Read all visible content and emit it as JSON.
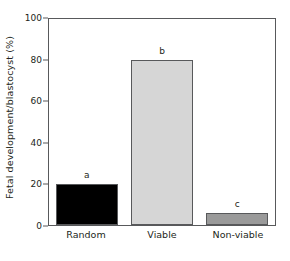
{
  "chart_data": {
    "type": "bar",
    "title": "",
    "xlabel": "",
    "ylabel": "Fetal development/blastocyst (%)",
    "categories": [
      "Random",
      "Viable",
      "Non-viable"
    ],
    "values": [
      20,
      80,
      6
    ],
    "annotations": [
      "a",
      "b",
      "c"
    ],
    "bar_colors": [
      "#000000",
      "#d6d6d6",
      "#9a9a9a"
    ],
    "bar_edge_color": "#58595b",
    "ylim": [
      0,
      100
    ],
    "yticks": [
      0,
      20,
      40,
      60,
      80,
      100
    ],
    "ytick_labels": [
      "0",
      "20",
      "40",
      "60",
      "80",
      "100"
    ],
    "grid": false,
    "legend": "none",
    "frame": "box"
  }
}
